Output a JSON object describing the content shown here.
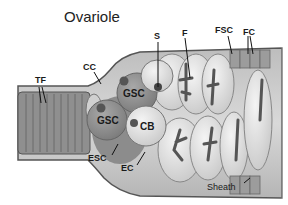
{
  "title": "Ovariole",
  "labels": {
    "tf": "TF",
    "cc": "CC",
    "s": "S",
    "f": "F",
    "fsc": "FSC",
    "fc": "FC",
    "gsc_top": "GSC",
    "gsc_bottom": "GSC",
    "cb": "CB",
    "esc": "ESC",
    "ec": "EC",
    "sheath": "Sheath"
  },
  "legend_meaning": {
    "TF": "terminal filament",
    "CC": "cap cell",
    "GSC": "germline stem cell",
    "CB": "cystoblast",
    "ESC": "escort stem cell",
    "EC": "escort cell",
    "S": "spectrosome",
    "F": "fusome",
    "FSC": "follicle stem cell",
    "FC": "follicle cell"
  }
}
